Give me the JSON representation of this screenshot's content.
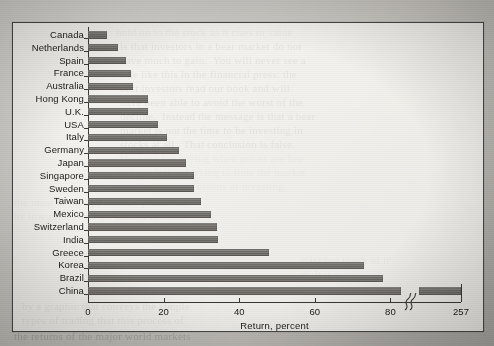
{
  "chart_data": {
    "type": "bar",
    "orientation": "horizontal",
    "title": "",
    "xlabel": "Return, percent",
    "ylabel": "",
    "categories": [
      "Canada",
      "Netherlands",
      "Spain",
      "France",
      "Australia",
      "Hong Kong",
      "U.K.",
      "USA",
      "Italy",
      "Germany",
      "Japan",
      "Singapore",
      "Sweden",
      "Taiwan",
      "Mexico",
      "Switzerland",
      "India",
      "Greece",
      "Korea",
      "Brazil",
      "China"
    ],
    "values": [
      5,
      8,
      10,
      11.5,
      12,
      16,
      16,
      18.5,
      21,
      24,
      26,
      28,
      28,
      30,
      32.5,
      34,
      34.5,
      48,
      73,
      78,
      257
    ],
    "xticks": [
      0,
      20,
      40,
      60,
      80,
      257
    ],
    "xtick_labels": [
      "0",
      "20",
      "40",
      "60",
      "80",
      "257"
    ],
    "xlim": [
      0,
      90
    ],
    "axis_break": {
      "present": true,
      "position_value": 85,
      "glyph": "squiggle",
      "note": "x-axis broken between 80 and 257"
    },
    "grid": false,
    "legend": false,
    "bar_color": "#76736e",
    "axis_color": "#3c3a36"
  },
  "figure": {
    "background_color": "#c6c4bf",
    "card_color": "#fcfbf8",
    "frame_border_color": "#4a4844"
  },
  "page_bleed": {
    "col_right": [
      "is that investors in a bear market do not",
      "have much to gain.  You will never see a",
      "title like this in the financial press: the",
      "best investors read our book and will",
      "have been able to avoid the worst of the",
      "decline.  Instead the message is that a bear",
      "market is not the time to be investing in",
      "stocks at all.  That conclusion is false."
    ],
    "col_bottom": [
      "the case for buying when prices are low",
      "and the folly of trying to time the market",
      "are the simplest lessons of investing."
    ],
    "col_top": [
      "hold on to the stock as it rises in value"
    ]
  }
}
